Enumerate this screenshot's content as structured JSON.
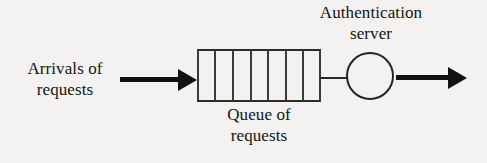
{
  "diagram": {
    "type": "queueing-model",
    "background_color": "#f3f2f0",
    "stroke_color": "#1a1a1a",
    "labels": {
      "arrivals": {
        "line1": "Arrivals of",
        "line2": "requests"
      },
      "queue": {
        "line1": "Queue of",
        "line2": "requests"
      },
      "server": {
        "line1": "Authentication",
        "line2": "server"
      }
    },
    "queue": {
      "cell_count": 7,
      "divider_count": 6,
      "divider_positions": [
        17,
        35,
        53,
        70,
        88,
        105
      ]
    },
    "arrows": {
      "inbound": "arrow-right",
      "outbound": "arrow-right"
    },
    "server_shape": "circle"
  }
}
